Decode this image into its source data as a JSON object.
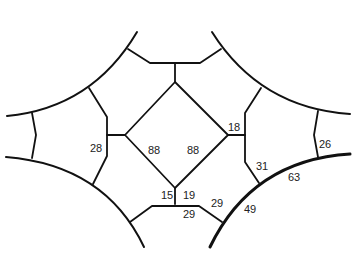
{
  "diagram": {
    "labels": {
      "left_vertical": "28",
      "diamond_left": "88",
      "diamond_right": "88",
      "right_junction": "18",
      "right_lower_edge": "31",
      "right_arc_edge": "26",
      "bottom_right_arc_upper": "63",
      "bottom_right_arc_lower": "49",
      "bottom_left_stem": "15",
      "bottom_right_stem": "19",
      "bottom_diag": "29",
      "bottom_horizontal": "29"
    },
    "colors": {
      "line": "#111111",
      "text": "#222222",
      "background": "#ffffff"
    }
  }
}
